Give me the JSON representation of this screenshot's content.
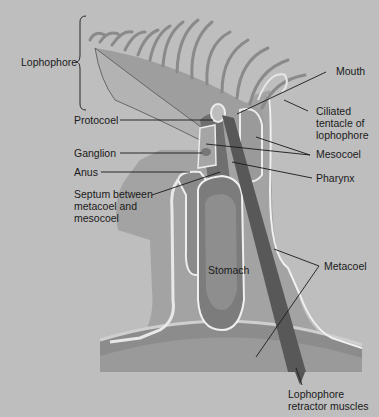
{
  "diagram": {
    "colors": {
      "background": "#bebebe",
      "tissue_light": "#a9a9a9",
      "tissue_mid": "#8f8f8f",
      "tissue_dark": "#6e6e6e",
      "muscle": "#5a5a5a",
      "membrane": "#ececec",
      "leader_line": "#1a1a1a",
      "text": "#1a1a1a"
    },
    "labels": {
      "lophophore": "Lophophore",
      "protocoel": "Protocoel",
      "ganglion": "Ganglion",
      "anus": "Anus",
      "septum": "Septum between\nmetacoel and\nmesocoel",
      "mouth": "Mouth",
      "ciliated_tentacle": "Ciliated\ntentacle of\nlophophore",
      "mesocoel": "Mesocoel",
      "pharynx": "Pharynx",
      "stomach": "Stomach",
      "metacoel": "Metacoel",
      "retractor_muscles": "Lophophore\nretractor muscles"
    }
  }
}
